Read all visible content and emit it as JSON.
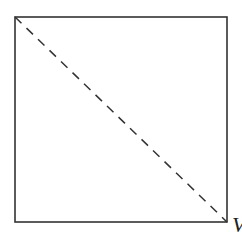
{
  "diagram": {
    "type": "square-with-diagonal",
    "square": {
      "x": 15,
      "y": 17,
      "width": 212,
      "height": 205,
      "stroke": "#333333",
      "stroke_width": 1.6
    },
    "diagonal": {
      "x1": 15,
      "y1": 17,
      "x2": 227,
      "y2": 222,
      "style": "dashed",
      "stroke": "#333333",
      "dash": "9,7"
    },
    "corner_label": "V"
  }
}
